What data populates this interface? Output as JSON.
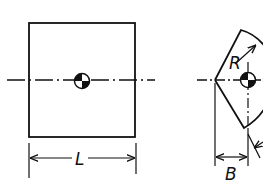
{
  "diagram": {
    "type": "engineering-drawing",
    "colors": {
      "line": "#111111",
      "background": "#ffffff"
    },
    "views": [
      {
        "name": "square-view",
        "shape": "square",
        "dimension_label": "L",
        "centerline": "horizontal dash-dot",
        "center_mark": "center-of-gravity symbol"
      },
      {
        "name": "lens-view",
        "shape": "curved wedge with radius arcs",
        "radius_label": "R",
        "dimension_label": "B",
        "centerline": "horizontal and vertical dash-dot",
        "center_mark": "center-of-gravity symbol"
      }
    ]
  }
}
